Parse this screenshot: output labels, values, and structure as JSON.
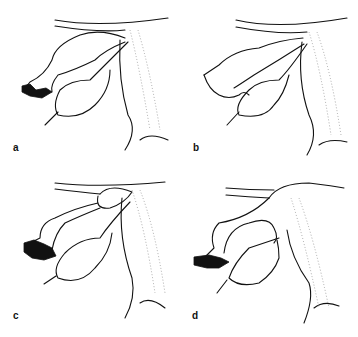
{
  "figure": {
    "panels": [
      {
        "id": "a",
        "label": "a"
      },
      {
        "id": "b",
        "label": "b"
      },
      {
        "id": "c",
        "label": "c"
      },
      {
        "id": "d",
        "label": "d"
      }
    ],
    "colors": {
      "line": "#111111",
      "stipple": "#888888",
      "background": "#ffffff"
    }
  }
}
